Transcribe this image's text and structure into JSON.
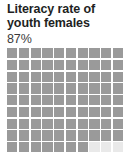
{
  "card": {
    "title": "Literacy rate of\nyouth females",
    "value_label": "87%"
  },
  "colors": {
    "filled": "#9a9a9a",
    "empty": "#e9e9e9",
    "title_text": "#221f1f",
    "value_text": "#3a3a3a",
    "background": "#ffffff"
  },
  "chart_data": {
    "type": "waffle",
    "title": "Literacy rate of youth females",
    "xlabel": "",
    "ylabel": "",
    "categories": [
      "Literate youth females",
      "Remaining"
    ],
    "values": [
      87,
      13
    ],
    "unit": "percent",
    "total_cells": 100,
    "filled_cells": 87,
    "empty_cells": 13,
    "grid_columns": 10,
    "grid_rows": 10,
    "cell_value": 1,
    "data_label": "87%",
    "legend": [],
    "grid": false,
    "note": "Bottom row of the 10x10 grid is cropped by the image edge"
  }
}
